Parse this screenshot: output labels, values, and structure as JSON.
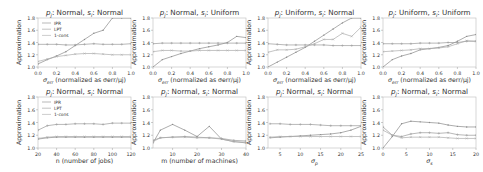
{
  "colors": {
    "IPR": "#8a8a8a",
    "LPT": "#9a9a9a",
    "1-cons": "#aaaaaa",
    "frame": "#bdbdbd",
    "text": "#333333"
  },
  "chart_data": [
    {
      "type": "line",
      "title": "p_j: Normal, s_i: Normal",
      "xlabel": "σ_err (normalized as σ_err/μ_j)",
      "ylabel": "Approximation",
      "xlim": [
        0.0,
        1.0
      ],
      "ylim": [
        1.0,
        1.8
      ],
      "xticks": [
        "0.0",
        "0.2",
        "0.4",
        "0.6",
        "0.8",
        "1.0"
      ],
      "yticks": [
        "1.0",
        "1.2",
        "1.4",
        "1.6",
        "1.8"
      ],
      "legend": [
        "IPR",
        "LPT",
        "1-cons"
      ],
      "legend_position": "upper left",
      "x": [
        0.0,
        0.1,
        0.2,
        0.3,
        0.4,
        0.5,
        0.6,
        0.7,
        0.8,
        0.9,
        1.0
      ],
      "series": [
        {
          "name": "IPR",
          "values": [
            1.05,
            1.12,
            1.18,
            1.25,
            1.35,
            1.45,
            1.55,
            1.6,
            1.8,
            1.95,
            2.05
          ]
        },
        {
          "name": "LPT",
          "values": [
            1.37,
            1.37,
            1.37,
            1.36,
            1.36,
            1.37,
            1.38,
            1.37,
            1.37,
            1.37,
            1.38
          ]
        },
        {
          "name": "1-cons",
          "values": [
            1.09,
            1.13,
            1.17,
            1.19,
            1.21,
            1.22,
            1.22,
            1.21,
            1.2,
            1.2,
            1.2
          ]
        }
      ]
    },
    {
      "type": "line",
      "title": "p_j: Normal, s_i: Uniform",
      "xlabel": "σ_err (normalized as σ_err/μ_j)",
      "ylabel": "Approximation",
      "xlim": [
        0.0,
        1.0
      ],
      "ylim": [
        1.0,
        1.8
      ],
      "xticks": [
        "0.0",
        "0.2",
        "0.4",
        "0.6",
        "0.8",
        "1.0"
      ],
      "yticks": [
        "1.0",
        "1.2",
        "1.4",
        "1.6",
        "1.8"
      ],
      "x": [
        0.0,
        0.1,
        0.2,
        0.3,
        0.4,
        0.5,
        0.6,
        0.7,
        0.8,
        0.9,
        1.0
      ],
      "series": [
        {
          "name": "IPR",
          "values": [
            1.0,
            1.12,
            1.17,
            1.22,
            1.26,
            1.3,
            1.33,
            1.36,
            1.4,
            1.5,
            1.48
          ]
        },
        {
          "name": "LPT",
          "values": [
            1.38,
            1.39,
            1.39,
            1.39,
            1.39,
            1.39,
            1.39,
            1.39,
            1.39,
            1.39,
            1.39
          ]
        },
        {
          "name": "1-cons",
          "values": [
            1.25,
            1.27,
            1.27,
            1.26,
            1.26,
            1.27,
            1.27,
            1.27,
            1.27,
            1.27,
            1.27
          ]
        }
      ]
    },
    {
      "type": "line",
      "title": "p_j: Uniform, s_i: Normal",
      "xlabel": "σ_err (normalized as σ_err/μ_j)",
      "ylabel": "Approximation",
      "xlim": [
        0.0,
        1.0
      ],
      "ylim": [
        1.0,
        1.8
      ],
      "xticks": [
        "0.0",
        "0.2",
        "0.4",
        "0.6",
        "0.8",
        "1.0"
      ],
      "yticks": [
        "1.0",
        "1.2",
        "1.4",
        "1.6",
        "1.8"
      ],
      "x": [
        0.0,
        0.1,
        0.2,
        0.3,
        0.4,
        0.5,
        0.6,
        0.7,
        0.8,
        0.9,
        1.0
      ],
      "series": [
        {
          "name": "IPR",
          "values": [
            1.0,
            1.08,
            1.16,
            1.24,
            1.32,
            1.42,
            1.52,
            1.62,
            1.72,
            1.8,
            1.88
          ]
        },
        {
          "name": "LPT",
          "values": [
            1.38,
            1.37,
            1.36,
            1.36,
            1.36,
            1.36,
            1.36,
            1.35,
            1.35,
            1.35,
            1.35
          ]
        },
        {
          "name": "1-cons",
          "values": [
            1.24,
            1.28,
            1.28,
            1.29,
            1.33,
            1.38,
            1.45,
            1.45,
            1.55,
            1.5,
            1.65
          ]
        }
      ]
    },
    {
      "type": "line",
      "title": "p_j: Uniform, s_i: Uniform",
      "xlabel": "σ_err (normalized as σ_err/μ_j)",
      "ylabel": "Approximation",
      "xlim": [
        0.0,
        1.0
      ],
      "ylim": [
        1.0,
        1.8
      ],
      "xticks": [
        "0.0",
        "0.2",
        "0.4",
        "0.6",
        "0.8",
        "1.0"
      ],
      "yticks": [
        "1.0",
        "1.2",
        "1.4",
        "1.6",
        "1.8"
      ],
      "x": [
        0.0,
        0.1,
        0.2,
        0.3,
        0.4,
        0.5,
        0.6,
        0.7,
        0.8,
        0.9,
        1.0
      ],
      "series": [
        {
          "name": "IPR",
          "values": [
            1.0,
            1.12,
            1.18,
            1.22,
            1.28,
            1.3,
            1.32,
            1.35,
            1.42,
            1.5,
            1.53
          ]
        },
        {
          "name": "LPT",
          "values": [
            1.38,
            1.38,
            1.38,
            1.38,
            1.39,
            1.39,
            1.39,
            1.4,
            1.4,
            1.42,
            1.42
          ]
        },
        {
          "name": "1-cons",
          "values": [
            1.25,
            1.26,
            1.27,
            1.28,
            1.3,
            1.3,
            1.31,
            1.33,
            1.38,
            1.43,
            1.42
          ]
        }
      ]
    },
    {
      "type": "line",
      "title": "p_j: Normal, s_i: Normal",
      "xlabel": "n (number of jobs)",
      "ylabel": "Approximation",
      "xlim": [
        20,
        120
      ],
      "ylim": [
        1.0,
        1.8
      ],
      "xticks": [
        "20",
        "40",
        "60",
        "80",
        "100",
        "120"
      ],
      "yticks": [
        "1.0",
        "1.2",
        "1.4",
        "1.6",
        "1.8"
      ],
      "legend": [
        "IPR",
        "LPT",
        "1-cons"
      ],
      "legend_position": "upper left",
      "x": [
        20,
        30,
        40,
        50,
        60,
        70,
        80,
        90,
        100,
        110,
        120
      ],
      "series": [
        {
          "name": "IPR",
          "values": [
            1.14,
            1.16,
            1.17,
            1.17,
            1.17,
            1.17,
            1.17,
            1.17,
            1.17,
            1.17,
            1.17
          ]
        },
        {
          "name": "LPT",
          "values": [
            1.28,
            1.35,
            1.37,
            1.37,
            1.38,
            1.38,
            1.38,
            1.37,
            1.39,
            1.39,
            1.39
          ]
        },
        {
          "name": "1-cons",
          "values": [
            1.15,
            1.17,
            1.18,
            1.18,
            1.18,
            1.18,
            1.18,
            1.18,
            1.18,
            1.18,
            1.18
          ]
        }
      ]
    },
    {
      "type": "line",
      "title": "p_j: Normal, s_i: Normal",
      "xlabel": "m (number of machines)",
      "ylabel": "Approximation",
      "xlim": [
        2,
        40
      ],
      "ylim": [
        1.0,
        1.8
      ],
      "xticks": [
        "10",
        "20",
        "30",
        "40"
      ],
      "yticks": [
        "1.0",
        "1.2",
        "1.4",
        "1.6",
        "1.8"
      ],
      "x": [
        2,
        5,
        10,
        15,
        20,
        25,
        30,
        35,
        40
      ],
      "series": [
        {
          "name": "IPR",
          "values": [
            1.08,
            1.28,
            1.37,
            1.28,
            1.18,
            1.34,
            1.14,
            1.1,
            1.08
          ]
        },
        {
          "name": "LPT",
          "values": [
            1.12,
            1.16,
            1.17,
            1.18,
            1.17,
            1.16,
            1.15,
            1.12,
            1.11
          ]
        },
        {
          "name": "1-cons",
          "values": [
            1.1,
            1.16,
            1.17,
            1.17,
            1.16,
            1.16,
            1.14,
            1.1,
            1.09
          ]
        }
      ]
    },
    {
      "type": "line",
      "title": "p_j: Normal, s_i: Normal",
      "xlabel": "σ_p",
      "ylabel": "Approximation",
      "xlim": [
        2,
        25
      ],
      "ylim": [
        1.0,
        1.8
      ],
      "xticks": [
        "5",
        "10",
        "15",
        "20",
        "25"
      ],
      "yticks": [
        "1.0",
        "1.2",
        "1.4",
        "1.6",
        "1.8"
      ],
      "x": [
        2.5,
        5,
        7.5,
        10,
        12.5,
        15,
        17.5,
        20,
        22.5,
        25
      ],
      "series": [
        {
          "name": "IPR",
          "values": [
            1.16,
            1.17,
            1.18,
            1.19,
            1.2,
            1.21,
            1.22,
            1.24,
            1.28,
            1.34
          ]
        },
        {
          "name": "LPT",
          "values": [
            1.38,
            1.38,
            1.37,
            1.37,
            1.37,
            1.36,
            1.35,
            1.35,
            1.35,
            1.35
          ]
        },
        {
          "name": "1-cons",
          "values": [
            1.17,
            1.18,
            1.18,
            1.18,
            1.18,
            1.18,
            1.18,
            1.18,
            1.18,
            1.18
          ]
        }
      ]
    },
    {
      "type": "line",
      "title": "p_j: Normal, s_i: Normal",
      "xlabel": "σ_s",
      "ylabel": "Approximation",
      "xlim": [
        0,
        20
      ],
      "ylim": [
        1.0,
        1.8
      ],
      "xticks": [
        "0",
        "5",
        "10",
        "15",
        "20"
      ],
      "yticks": [
        "1.0",
        "1.2",
        "1.4",
        "1.6",
        "1.8"
      ],
      "x": [
        0,
        2,
        4,
        6,
        8,
        10,
        12,
        14,
        16,
        18,
        20
      ],
      "series": [
        {
          "name": "IPR",
          "values": [
            1.0,
            1.18,
            1.38,
            1.42,
            1.41,
            1.4,
            1.39,
            1.36,
            1.34,
            1.33,
            1.33
          ]
        },
        {
          "name": "LPT",
          "values": [
            1.33,
            1.2,
            1.18,
            1.22,
            1.24,
            1.24,
            1.23,
            1.24,
            1.21,
            1.2,
            1.2
          ]
        },
        {
          "name": "1-cons",
          "values": [
            1.28,
            1.2,
            1.16,
            1.17,
            1.17,
            1.17,
            1.17,
            1.16,
            1.15,
            1.15,
            1.15
          ]
        }
      ]
    }
  ]
}
